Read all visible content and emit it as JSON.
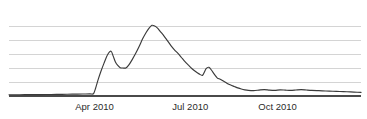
{
  "chart_data": {
    "type": "line",
    "title": "",
    "subtitle": "",
    "xlabel": "",
    "ylabel": "",
    "grid": true,
    "legend": false,
    "legend_position": "none",
    "gridline_count": 5,
    "axis_baseline_visible": true,
    "series_color": "#3a3a3a",
    "gridline_color": "#c9c9c9",
    "axis_color": "#4a4a4a",
    "background_color": "#ffffff",
    "xlim": [
      0,
      100
    ],
    "ylim": [
      0,
      6
    ],
    "y_tick_values": [
      1,
      2,
      3,
      4,
      5
    ],
    "x_tick_labels": [
      "Apr 2010",
      "Jul 2010",
      "Oct 2010"
    ],
    "x_tick_positions": [
      24.3,
      51.5,
      76.3
    ],
    "series": [
      {
        "name": "search interest",
        "x": [
          0,
          3,
          6,
          9,
          12,
          15,
          18,
          21,
          23,
          24,
          24.6,
          25.3,
          26.1,
          27.0,
          28.0,
          29.0,
          29.6,
          30.2,
          30.9,
          31.6,
          32.4,
          33.2,
          34.0,
          35.0,
          36.0,
          37.0,
          38.0,
          39.0,
          39.8,
          40.6,
          41.4,
          42.2,
          43.0,
          44.0,
          45.0,
          46.0,
          47.0,
          48.0,
          49.0,
          50.0,
          51.0,
          52.0,
          53.0,
          54.0,
          55.0,
          56.0,
          56.8,
          57.6,
          58.4,
          59.2,
          60.0,
          61.0,
          62.0,
          63.0,
          64.0,
          65.0,
          66.0,
          67.0,
          68.0,
          69.5,
          71.0,
          72.5,
          74.0,
          75.5,
          77.0,
          78.5,
          80.0,
          81.5,
          83.0,
          84.5,
          86.0,
          88.0,
          90.0,
          92.0,
          94.0,
          96.0,
          98.0,
          100.0
        ],
        "y": [
          0.09,
          0.09,
          0.1,
          0.1,
          0.11,
          0.12,
          0.13,
          0.14,
          0.15,
          0.16,
          0.55,
          1.15,
          1.75,
          2.35,
          2.95,
          3.2,
          2.85,
          2.45,
          2.18,
          2.02,
          2.0,
          2.0,
          2.2,
          2.6,
          3.05,
          3.55,
          4.1,
          4.55,
          4.85,
          5.05,
          5.0,
          4.85,
          4.6,
          4.3,
          3.95,
          3.6,
          3.3,
          3.05,
          2.75,
          2.45,
          2.2,
          1.95,
          1.75,
          1.58,
          1.48,
          1.95,
          2.05,
          1.82,
          1.52,
          1.28,
          1.2,
          1.05,
          0.9,
          0.78,
          0.68,
          0.58,
          0.5,
          0.44,
          0.4,
          0.38,
          0.42,
          0.46,
          0.42,
          0.4,
          0.44,
          0.42,
          0.4,
          0.43,
          0.46,
          0.43,
          0.4,
          0.38,
          0.36,
          0.34,
          0.32,
          0.3,
          0.28,
          0.26
        ]
      }
    ],
    "annotations": []
  }
}
